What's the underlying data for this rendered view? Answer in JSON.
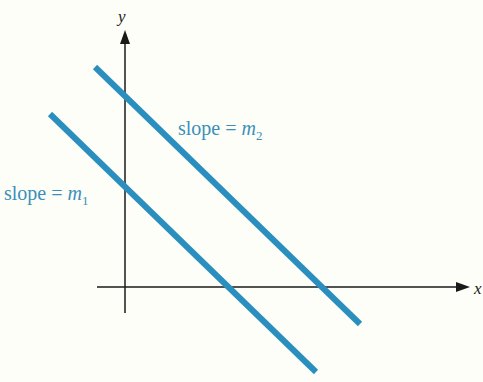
{
  "colors": {
    "background": "#fefef8",
    "line": "#2a8fbf",
    "axis": "#1a1a1a",
    "label": "#3a8fba"
  },
  "axes": {
    "x_label": "x",
    "y_label": "y"
  },
  "lines": [
    {
      "id": "line1",
      "label_prefix": "slope = ",
      "label_var": "m",
      "label_sub": "1"
    },
    {
      "id": "line2",
      "label_prefix": "slope = ",
      "label_var": "m",
      "label_sub": "2"
    }
  ]
}
